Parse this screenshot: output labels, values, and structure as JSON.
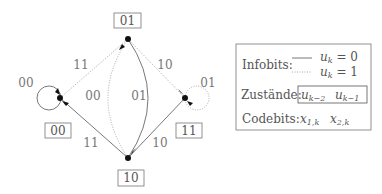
{
  "diagram": {
    "type": "state-transition",
    "states": [
      {
        "id": "01",
        "label": "01"
      },
      {
        "id": "00",
        "label": "00"
      },
      {
        "id": "11",
        "label": "11"
      },
      {
        "id": "10",
        "label": "10"
      }
    ],
    "transitions": [
      {
        "from": "00",
        "to": "00",
        "label": "00",
        "style": "solid"
      },
      {
        "from": "00",
        "to": "01",
        "label": "11",
        "style": "dotted"
      },
      {
        "from": "01",
        "to": "10",
        "label": "00",
        "style": "dotted"
      },
      {
        "from": "01",
        "to": "10",
        "label": "01",
        "style": "solid"
      },
      {
        "from": "01",
        "to": "11",
        "label": "10",
        "style": "dotted"
      },
      {
        "from": "11",
        "to": "11",
        "label": "01",
        "style": "dotted"
      },
      {
        "from": "10",
        "to": "00",
        "label": "11",
        "style": "solid"
      },
      {
        "from": "10",
        "to": "11",
        "label": "10",
        "style": "solid"
      }
    ]
  },
  "legend": {
    "infobits_label": "Infobits:",
    "solid_text": "u_k = 0",
    "dotted_text": "u_k = 1",
    "zustaende_label": "Zustände:",
    "state_a": "u_{k−2}",
    "state_b": "u_{k−1}",
    "codebits_label": "Codebits:",
    "code_a": "x_{1,k}",
    "code_b": "x_{2,k}"
  }
}
